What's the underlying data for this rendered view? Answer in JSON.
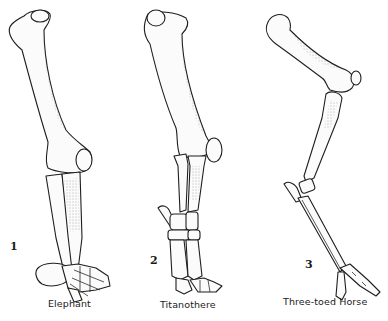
{
  "figure": {
    "specimens": [
      {
        "number": "1",
        "label": "Elephant"
      },
      {
        "number": "2",
        "label": "Titanothere"
      },
      {
        "number": "3",
        "label": "Three-toed Horse"
      }
    ]
  },
  "colors": {
    "background": "#ffffff",
    "ink": "#1e1e1e",
    "bone": "#fbfbfb"
  }
}
